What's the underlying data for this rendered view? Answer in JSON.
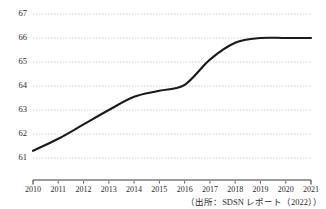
{
  "chart_data": {
    "type": "line",
    "title": "",
    "subtitle": "",
    "xlabel": "",
    "ylabel": "",
    "categories": [
      "2010",
      "2011",
      "2012",
      "2013",
      "2014",
      "2015",
      "2016",
      "2017",
      "2018",
      "2019",
      "2020",
      "2021"
    ],
    "values": [
      61.3,
      61.8,
      62.4,
      63.0,
      63.55,
      63.8,
      64.05,
      65.1,
      65.8,
      66.0,
      66.0,
      66.0
    ],
    "series": [
      {
        "name": "",
        "values": [
          61.3,
          61.8,
          62.4,
          63.0,
          63.55,
          63.8,
          64.05,
          65.1,
          65.8,
          66.0,
          66.0,
          66.0
        ]
      }
    ],
    "ylim": [
      61,
      67
    ],
    "xlim": [
      "2010",
      "2021"
    ],
    "ytick_labels": [
      "61",
      "62",
      "63",
      "64",
      "65",
      "66",
      "67"
    ],
    "ytick_values": [
      61,
      62,
      63,
      64,
      65,
      66,
      67
    ],
    "xtick_labels": [
      "2010",
      "2011",
      "2012",
      "2013",
      "2014",
      "2015",
      "2016",
      "2017",
      "2018",
      "2019",
      "2020",
      "2021"
    ],
    "grid": "horizontal-dotted",
    "legend": "none",
    "line_color": "#1a1a1a",
    "grid_color": "#b9b9b9",
    "axis_color": "#3a3a3a",
    "background": "#ffffff",
    "annotations": []
  },
  "footer": {
    "source_note": "（出所：SDSN レポート（2022））"
  }
}
